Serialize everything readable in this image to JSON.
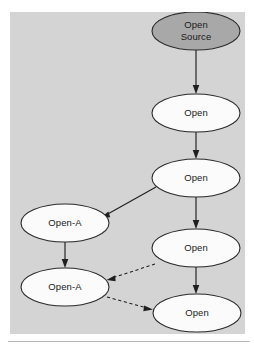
{
  "figure": {
    "title": "",
    "panel": {
      "background_color": "#d4d4d4",
      "x": 10,
      "y": 12,
      "width": 235,
      "height": 322
    },
    "page_background_color": "#ffffff",
    "footer_rule_color": "#b9b9b9"
  },
  "diagram": {
    "type": "flow-graph",
    "node_shape": "ellipse",
    "node_outline_color": "#2b2b2b",
    "node_default_fill": "#fbfbfb",
    "node_highlight_fill": "#a8a8a8",
    "edge_color": "#1f1f1f",
    "nodes": [
      {
        "id": "n1",
        "label": "Open Source",
        "label_lines": [
          "Open",
          "Source"
        ],
        "cx": 186,
        "cy": 19,
        "rx": 44,
        "ry": 19,
        "fill": "#a8a8a8",
        "highlighted": true
      },
      {
        "id": "n2",
        "label": "Open",
        "label_lines": [
          "Open"
        ],
        "cx": 186,
        "cy": 101,
        "rx": 44,
        "ry": 19,
        "fill": "#fbfbfb",
        "highlighted": false
      },
      {
        "id": "n3",
        "label": "Open",
        "label_lines": [
          "Open"
        ],
        "cx": 186,
        "cy": 166,
        "rx": 44,
        "ry": 19,
        "fill": "#fbfbfb",
        "highlighted": false
      },
      {
        "id": "n4",
        "label": "Open-A",
        "label_lines": [
          "Open-A"
        ],
        "cx": 55,
        "cy": 211,
        "rx": 44,
        "ry": 19,
        "fill": "#fbfbfb",
        "highlighted": false
      },
      {
        "id": "n5",
        "label": "Open",
        "label_lines": [
          "Open"
        ],
        "cx": 186,
        "cy": 236,
        "rx": 44,
        "ry": 19,
        "fill": "#fbfbfb",
        "highlighted": false
      },
      {
        "id": "n6",
        "label": "Open-A",
        "label_lines": [
          "Open-A"
        ],
        "cx": 55,
        "cy": 275,
        "rx": 44,
        "ry": 19,
        "fill": "#fbfbfb",
        "highlighted": false
      },
      {
        "id": "n7",
        "label": "Open",
        "label_lines": [
          "Open"
        ],
        "cx": 187,
        "cy": 301,
        "rx": 44,
        "ry": 19,
        "fill": "#fbfbfb",
        "highlighted": false
      }
    ],
    "edges": [
      {
        "id": "e1",
        "from": "n1",
        "to": "n2",
        "style": "solid",
        "arrow": true
      },
      {
        "id": "e2",
        "from": "n2",
        "to": "n3",
        "style": "solid",
        "arrow": true
      },
      {
        "id": "e3",
        "from": "n3",
        "to": "n4",
        "style": "solid",
        "arrow": true
      },
      {
        "id": "e4",
        "from": "n3",
        "to": "n5",
        "style": "solid",
        "arrow": true
      },
      {
        "id": "e5",
        "from": "n4",
        "to": "n6",
        "style": "solid",
        "arrow": true
      },
      {
        "id": "e6",
        "from": "n5",
        "to": "n6",
        "style": "dashed",
        "arrow": true
      },
      {
        "id": "e7",
        "from": "n5",
        "to": "n7",
        "style": "solid",
        "arrow": true
      },
      {
        "id": "e8",
        "from": "n6",
        "to": "n7",
        "style": "dashed",
        "arrow": true
      }
    ]
  }
}
